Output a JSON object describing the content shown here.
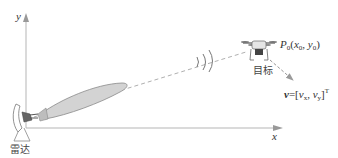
{
  "diagram": {
    "axes": {
      "x_label": "x",
      "y_label": "y"
    },
    "radar": {
      "label": "雷达"
    },
    "target": {
      "label": "目标",
      "position_label": {
        "P": "P",
        "sub": "0",
        "open": "(",
        "x": "x",
        "xsub": "0",
        "comma": ", ",
        "y": "y",
        "ysub": "0",
        "close": ")"
      },
      "velocity_label": {
        "v": "v",
        "eq": "=[",
        "vx": "v",
        "xsub": "x",
        "comma": ", ",
        "vy": "v",
        "ysub": "y",
        "close": "]",
        "sup": "T"
      }
    },
    "colors": {
      "axis": "#b0b0b0",
      "beam_fill": "#d4d4d4",
      "beam_stroke": "#8a8a8a",
      "dash": "#9a9a9a",
      "text": "#333333"
    }
  }
}
